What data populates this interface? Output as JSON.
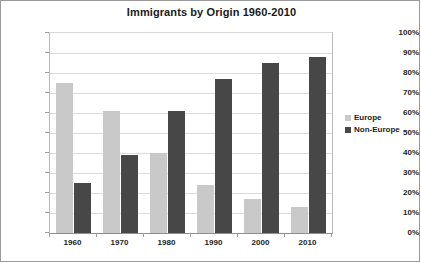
{
  "chart_data": {
    "type": "bar",
    "title": "Immigrants by Origin 1960-2010",
    "xlabel": "",
    "ylabel": "",
    "categories": [
      "1960",
      "1970",
      "1980",
      "1990",
      "2000",
      "2010"
    ],
    "series": [
      {
        "name": "Europe",
        "color": "#c9c9c9",
        "values": [
          75,
          61,
          40,
          24,
          17,
          13
        ]
      },
      {
        "name": "Non-Europe",
        "color": "#474747",
        "values": [
          25,
          39,
          61,
          77,
          85,
          88
        ]
      }
    ],
    "ylim": [
      0,
      100
    ],
    "ytick_labels": [
      "100%",
      "90%",
      "80%",
      "70%",
      "60%",
      "50%",
      "40%",
      "30%",
      "20%",
      "10%",
      "0%"
    ],
    "ytick_values": [
      100,
      90,
      80,
      70,
      60,
      50,
      40,
      30,
      20,
      10,
      0
    ],
    "grid": true,
    "legend_position": "right"
  }
}
